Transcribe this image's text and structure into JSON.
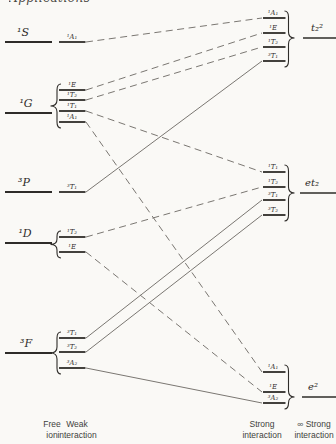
{
  "page": {
    "header_partial_text": "Applications",
    "background": "#faf9f6",
    "ink_color": "#2e2c29",
    "correlation_line_color": "#7a7772",
    "label_color": "#413f3c"
  },
  "diagram": {
    "free_ion": [
      {
        "term": "¹S",
        "y": 42,
        "x1": 5,
        "x2": 52,
        "label_x": 23
      },
      {
        "term": "¹G",
        "y": 113,
        "x1": 5,
        "x2": 52,
        "label_x": 26
      },
      {
        "term": "³P",
        "y": 192,
        "x1": 5,
        "x2": 52,
        "label_x": 24
      },
      {
        "term": "¹D",
        "y": 243,
        "x1": 5,
        "x2": 52,
        "label_x": 25
      },
      {
        "term": "³F",
        "y": 353,
        "x1": 5,
        "x2": 52,
        "label_x": 26
      }
    ],
    "weak_groups": [
      {
        "parent": "¹S",
        "brace": false,
        "levels": [
          {
            "term": "¹A₁",
            "y": 42
          }
        ]
      },
      {
        "parent": "¹G",
        "brace": true,
        "levels": [
          {
            "term": "¹E",
            "y": 90
          },
          {
            "term": "¹T₂",
            "y": 100
          },
          {
            "term": "¹T₁",
            "y": 111
          },
          {
            "term": "¹A₁",
            "y": 122
          }
        ]
      },
      {
        "parent": "³P",
        "brace": false,
        "levels": [
          {
            "term": "³T₁",
            "y": 192
          }
        ]
      },
      {
        "parent": "¹D",
        "brace": true,
        "levels": [
          {
            "term": "¹T₂",
            "y": 237
          },
          {
            "term": "¹E",
            "y": 252
          }
        ]
      },
      {
        "parent": "³F",
        "brace": true,
        "levels": [
          {
            "term": "³T₁",
            "y": 338
          },
          {
            "term": "³T₂",
            "y": 352
          },
          {
            "term": "³A₂",
            "y": 368
          }
        ]
      }
    ],
    "strong_groups": [
      {
        "config": "t₂²",
        "label_x": 317,
        "line": {
          "x1": 303,
          "x2": 336,
          "y": 38
        },
        "levels": [
          {
            "term": "¹A₁",
            "y": 18
          },
          {
            "term": "¹E",
            "y": 33
          },
          {
            "term": "¹T₂",
            "y": 47
          },
          {
            "term": "³T₁",
            "y": 61
          }
        ]
      },
      {
        "config": "et₂",
        "label_x": 312,
        "line": {
          "x1": 300,
          "x2": 336,
          "y": 193
        },
        "levels": [
          {
            "term": "¹T₁",
            "y": 172
          },
          {
            "term": "¹T₂",
            "y": 187
          },
          {
            "term": "³T₁",
            "y": 200
          },
          {
            "term": "³T₂",
            "y": 215
          }
        ]
      },
      {
        "config": "e²",
        "label_x": 313,
        "line": {
          "x1": 302,
          "x2": 336,
          "y": 397
        },
        "levels": [
          {
            "term": "¹A₁",
            "y": 372
          },
          {
            "term": "¹E",
            "y": 392
          },
          {
            "term": "³A₂",
            "y": 403
          }
        ]
      }
    ],
    "correlations": [
      {
        "from": "¹A₁ (¹S)",
        "to": "¹A₁ (t₂²)",
        "x1": 86,
        "y1": 42,
        "x2": 262,
        "y2": 18,
        "style": "dashed"
      },
      {
        "from": "¹E (¹G)",
        "to": "¹E (t₂²)",
        "x1": 86,
        "y1": 90,
        "x2": 262,
        "y2": 33,
        "style": "dashed"
      },
      {
        "from": "¹T₂ (¹G)",
        "to": "¹T₂ (t₂²)",
        "x1": 86,
        "y1": 100,
        "x2": 262,
        "y2": 47,
        "style": "dashed"
      },
      {
        "from": "¹T₁ (¹G)",
        "to": "¹T₁ (et₂)",
        "x1": 86,
        "y1": 111,
        "x2": 262,
        "y2": 172,
        "style": "dashed"
      },
      {
        "from": "¹A₁ (¹G)",
        "to": "¹A₁ (e²)",
        "x1": 86,
        "y1": 122,
        "x2": 262,
        "y2": 372,
        "style": "dashed"
      },
      {
        "from": "³T₁ (³P)",
        "to": "³T₁ (t₂²)",
        "x1": 86,
        "y1": 192,
        "x2": 262,
        "y2": 61,
        "style": "solid"
      },
      {
        "from": "¹T₂ (¹D)",
        "to": "¹T₂ (et₂)",
        "x1": 86,
        "y1": 237,
        "x2": 262,
        "y2": 187,
        "style": "dashed"
      },
      {
        "from": "¹E (¹D)",
        "to": "¹E (e²)",
        "x1": 86,
        "y1": 252,
        "x2": 262,
        "y2": 392,
        "style": "dashed"
      },
      {
        "from": "³T₁ (³F)",
        "to": "³T₁ (et₂)",
        "x1": 86,
        "y1": 338,
        "x2": 262,
        "y2": 200,
        "style": "solid"
      },
      {
        "from": "³T₂ (³F)",
        "to": "³T₂ (et₂)",
        "x1": 86,
        "y1": 352,
        "x2": 262,
        "y2": 215,
        "style": "solid"
      },
      {
        "from": "³A₂ (³F)",
        "to": "³A₂ (e²)",
        "x1": 86,
        "y1": 368,
        "x2": 262,
        "y2": 403,
        "style": "solid"
      }
    ],
    "axis": [
      {
        "x": 52,
        "lines": [
          "Free",
          "ion"
        ]
      },
      {
        "x": 77,
        "lines": [
          "Weak",
          "interaction"
        ]
      },
      {
        "x": 262,
        "lines": [
          "Strong",
          "interaction"
        ]
      },
      {
        "x": 314,
        "lines": [
          "∞ Strong",
          "interaction"
        ]
      }
    ]
  }
}
